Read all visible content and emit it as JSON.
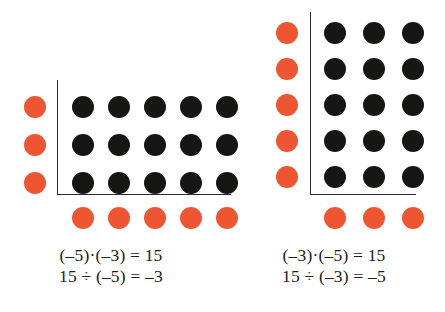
{
  "figure": {
    "background_color": "#ffffff",
    "dot_colors": {
      "product": "#161614",
      "factor": "#ee5633"
    },
    "axis_color": "#2b2b2b"
  },
  "panels": [
    {
      "id": "left",
      "columns": 5,
      "rows": 3,
      "black_dot_count": 15,
      "red_column_count": 3,
      "red_row_count": 5,
      "equations": [
        "(–5)·(–3) = 15",
        "15 ÷ (–5) = –3"
      ]
    },
    {
      "id": "right",
      "columns": 3,
      "rows": 5,
      "black_dot_count": 15,
      "red_column_count": 5,
      "red_row_count": 3,
      "equations": [
        "(–3)·(–5) = 15",
        "15 ÷ (–3) = –5"
      ]
    }
  ]
}
